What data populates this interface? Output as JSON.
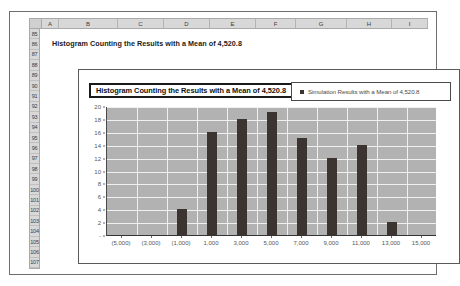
{
  "spreadsheet": {
    "columns": [
      "A",
      "B",
      "C",
      "D",
      "E",
      "F",
      "G",
      "H",
      "I"
    ],
    "rows": [
      "85",
      "86",
      "87",
      "88",
      "89",
      "90",
      "91",
      "92",
      "93",
      "94",
      "95",
      "96",
      "97",
      "98",
      "99",
      "100",
      "101",
      "102",
      "103",
      "104",
      "105",
      "106",
      "107"
    ],
    "cell_b86": "Histogram Counting the  Results with a Mean of 4,520.8"
  },
  "chart_data": {
    "type": "bar",
    "title": "Histogram Counting the  Results with a Mean of 4,520.8",
    "xlabel": "",
    "ylabel": "",
    "grid": true,
    "legend_position": "top-right",
    "legend": [
      "Simulation Results with a Mean of 4,520.8"
    ],
    "series_color": "#3b3430",
    "plot_background": "#b2b2b2",
    "categories": [
      "(5,000)",
      "(3,000)",
      "(1,000)",
      "1,000",
      "3,000",
      "5,000",
      "7,000",
      "9,000",
      "11,000",
      "13,000",
      "15,000"
    ],
    "values": [
      0,
      0,
      4,
      16,
      18,
      19,
      15,
      12,
      14,
      2,
      0
    ],
    "ylim": [
      0,
      20
    ],
    "yticks": [
      "-",
      "2",
      "4",
      "6",
      "8",
      "10",
      "12",
      "14",
      "16",
      "18",
      "20"
    ],
    "ytick_values": [
      0,
      2,
      4,
      6,
      8,
      10,
      12,
      14,
      16,
      18,
      20
    ],
    "series": [
      {
        "name": "Simulation Results with a Mean of 4,520.8",
        "values": [
          0,
          0,
          4,
          16,
          18,
          19,
          15,
          12,
          14,
          2,
          0
        ]
      }
    ]
  }
}
